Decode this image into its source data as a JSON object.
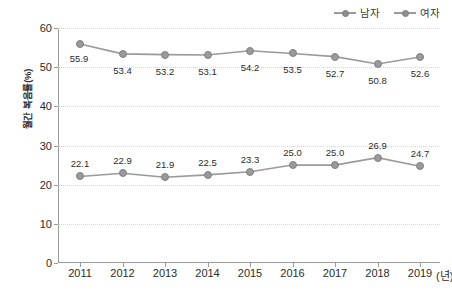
{
  "chart_data": {
    "type": "line",
    "title": "",
    "xlabel": "(년)",
    "ylabel": "월간 복음률(%)",
    "categories": [
      "2011",
      "2012",
      "2013",
      "2014",
      "2015",
      "2016",
      "2017",
      "2018",
      "2019"
    ],
    "ylim": [
      0,
      60
    ],
    "yticks": [
      0,
      10,
      20,
      30,
      40,
      50,
      60
    ],
    "ytick_labels": [
      "0",
      "10",
      "20",
      "30",
      "40",
      "50",
      "60"
    ],
    "grid": true,
    "legend_position": "top-right",
    "series": [
      {
        "name": "남자",
        "color": "#9a9a9a",
        "values": [
          55.9,
          53.4,
          53.2,
          53.1,
          54.2,
          53.5,
          52.7,
          50.8,
          52.6
        ],
        "value_labels": [
          "55.9",
          "53.4",
          "53.2",
          "53.1",
          "54.2",
          "53.5",
          "52.7",
          "50.8",
          "52.6"
        ],
        "label_offsets": [
          {
            "dx": -1,
            "dy": 14
          },
          {
            "dx": 0,
            "dy": 16
          },
          {
            "dx": 0,
            "dy": 16
          },
          {
            "dx": 0,
            "dy": 16
          },
          {
            "dx": 0,
            "dy": 16
          },
          {
            "dx": 0,
            "dy": 16
          },
          {
            "dx": 0,
            "dy": 16
          },
          {
            "dx": 0,
            "dy": 16
          },
          {
            "dx": 0,
            "dy": 16
          }
        ]
      },
      {
        "name": "여자",
        "color": "#9a9a9a",
        "values": [
          22.1,
          22.9,
          21.9,
          22.5,
          23.3,
          25.0,
          25.0,
          26.9,
          24.7
        ],
        "value_labels": [
          "22.1",
          "22.9",
          "21.9",
          "22.5",
          "23.3",
          "25.0",
          "25.0",
          "26.9",
          "24.7"
        ],
        "label_offsets": [
          {
            "dx": 0,
            "dy": -13
          },
          {
            "dx": 0,
            "dy": -13
          },
          {
            "dx": 0,
            "dy": -13
          },
          {
            "dx": 0,
            "dy": -13
          },
          {
            "dx": 0,
            "dy": -13
          },
          {
            "dx": 0,
            "dy": -13
          },
          {
            "dx": 0,
            "dy": -13
          },
          {
            "dx": 0,
            "dy": -13
          },
          {
            "dx": 0,
            "dy": -13
          }
        ]
      }
    ]
  },
  "axis": {
    "y_title": "월간 복음률(%)",
    "x_unit": "(년)"
  },
  "colors": {
    "line": "#9a9a9a",
    "marker_fill": "#9a9a9a",
    "marker_stroke": "#818181",
    "axis": "#9b9b9b",
    "grid": "#d9d3cc",
    "text": "#2b2b2b",
    "background": "#ffffff"
  }
}
